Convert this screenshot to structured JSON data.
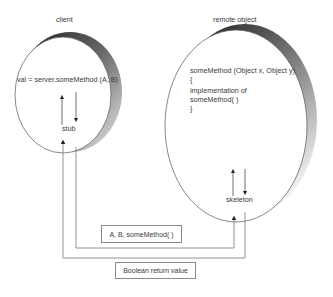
{
  "client": {
    "title": "client",
    "call_line": "val = server.someMethod (A, B)",
    "stub_label": "stub"
  },
  "remote": {
    "title": "remote object",
    "code_lines": [
      "someMethod (Object x, Object y)",
      "{",
      "implementation of",
      "someMethod( )",
      "}"
    ],
    "skeleton_label": "skeleton"
  },
  "messages": {
    "request": "A, B, someMethod( )",
    "response": "Boolean return value"
  },
  "colors": {
    "line": "#7a7a7a",
    "outline": "#555555",
    "shadow_dark": "#2a2a2a",
    "shadow_light": "#e0e0e0"
  }
}
